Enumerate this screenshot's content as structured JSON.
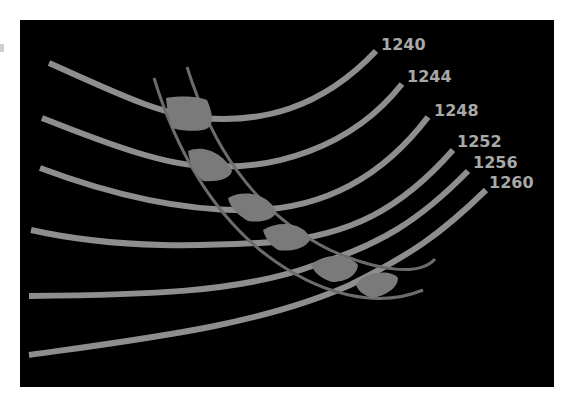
{
  "diagram": {
    "background": "#000000",
    "curve_color": "#8e8e8e",
    "band_color": "#6c6c6c",
    "blob_color": "#7a7a7a",
    "label_color": "#a8a8a8",
    "curves": [
      {
        "label": "1240"
      },
      {
        "label": "1244"
      },
      {
        "label": "1248"
      },
      {
        "label": "1252"
      },
      {
        "label": "1256"
      },
      {
        "label": "1260"
      }
    ],
    "band": {
      "description": "curved band crossing all contours"
    },
    "highlighted_intersections": 6
  }
}
